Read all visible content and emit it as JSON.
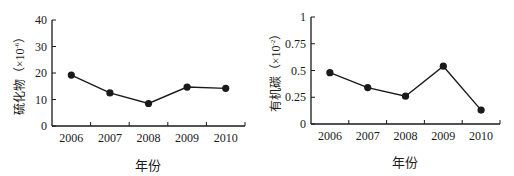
{
  "chart_data": [
    {
      "type": "line",
      "title": "",
      "xlabel": "年份",
      "ylabel": "硫化物（×10⁻⁶）",
      "ylabel_main": "硫化物（×10",
      "ylabel_exp": "-6",
      "ylabel_close": "）",
      "categories": [
        "2006",
        "2007",
        "2008",
        "2009",
        "2010"
      ],
      "series": [
        {
          "name": "硫化物",
          "values": [
            19.2,
            12.5,
            8.5,
            14.7,
            14.2
          ]
        }
      ],
      "yticks": [
        0,
        10,
        20,
        30,
        40
      ],
      "ytick_labels": [
        "0",
        "10",
        "20",
        "30",
        "40"
      ],
      "ylim": [
        0,
        40
      ],
      "grid": false,
      "legend": "none",
      "marker": "filled-circle",
      "color": "#1a1a1a"
    },
    {
      "type": "line",
      "title": "",
      "xlabel": "年份",
      "ylabel": "有机碳（×10⁻²）",
      "ylabel_main": "有机碳（×10",
      "ylabel_exp": "-2",
      "ylabel_close": "）",
      "categories": [
        "2006",
        "2007",
        "2008",
        "2009",
        "2010"
      ],
      "series": [
        {
          "name": "有机碳",
          "values": [
            0.48,
            0.34,
            0.26,
            0.54,
            0.13
          ]
        }
      ],
      "yticks": [
        0,
        0.25,
        0.5,
        0.75,
        1
      ],
      "ytick_labels": [
        "0",
        "0.25",
        "0.5",
        "0.75",
        "1"
      ],
      "ylim": [
        0,
        1
      ],
      "grid": false,
      "legend": "none",
      "marker": "filled-circle",
      "color": "#1a1a1a"
    }
  ]
}
